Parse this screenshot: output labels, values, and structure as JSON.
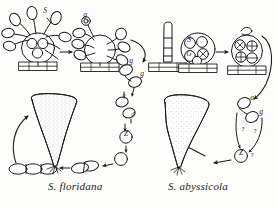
{
  "figure": {
    "kind": "life-cycle-diagram",
    "background_color": "#fdfdfb",
    "ink_color": "#1b1b1b",
    "stipple_color": "#9a958c",
    "width": 278,
    "height": 209,
    "panels": [
      {
        "id": "left",
        "caption": "S. floridana",
        "genus_abbrev": "S.",
        "species": "floridana"
      },
      {
        "id": "right",
        "caption": "S. abyssicola",
        "genus_abbrev": "S.",
        "species": "abyssicola"
      }
    ]
  },
  "captions": {
    "left": "S. floridana",
    "right": "S. abyssicola"
  },
  "labels": {
    "left_panel": [
      {
        "id": "l-s",
        "text": "S",
        "x": 45,
        "y": 13
      },
      {
        "id": "l-g-top",
        "text": "g",
        "x": 85,
        "y": 17
      },
      {
        "id": "l-g-1",
        "text": "g",
        "x": 131,
        "y": 63
      },
      {
        "id": "l-g-2",
        "text": "g",
        "x": 142,
        "y": 76
      },
      {
        "id": "l-female",
        "text": "♀",
        "x": 124,
        "y": 99
      },
      {
        "id": "l-male",
        "text": "♂",
        "x": 133,
        "y": 117
      },
      {
        "id": "l-z",
        "text": "Z",
        "x": 126,
        "y": 136
      }
    ],
    "right_panel": [
      {
        "id": "r-s",
        "text": "S",
        "x": 189,
        "y": 42
      },
      {
        "id": "r-g",
        "text": "G",
        "x": 189,
        "y": 56
      },
      {
        "id": "r-a1",
        "text": "a",
        "x": 252,
        "y": 100
      },
      {
        "id": "r-g1",
        "text": "g",
        "x": 261,
        "y": 114
      },
      {
        "id": "r-q1",
        "text": "?",
        "x": 243,
        "y": 131
      },
      {
        "id": "r-q2",
        "text": "?",
        "x": 255,
        "y": 133
      },
      {
        "id": "r-z",
        "text": "Z",
        "x": 241,
        "y": 155
      },
      {
        "id": "r-q3",
        "text": "?",
        "x": 252,
        "y": 157
      }
    ]
  },
  "symbols": {
    "plus": "+",
    "minus": "−",
    "cross": "×",
    "female": "♀",
    "male": "♂",
    "zygote": "Z",
    "sporangium": "S",
    "gametangium": "G",
    "question": "?"
  },
  "structures": {
    "left_panel": [
      {
        "name": "sporulating-thallus",
        "note": "ovoid body with three internal spore circles on branched stalks, hatched basal plate"
      },
      {
        "name": "empty-thallus",
        "note": "discharged ovoid body with external spore ovals, hatched basal plate"
      },
      {
        "name": "released-spores",
        "note": "chain of free oval spores"
      },
      {
        "name": "gamete-pair",
        "note": "two gametes labelled g"
      },
      {
        "name": "female-gamete",
        "note": "gamete marked with female sign"
      },
      {
        "name": "male-gamete",
        "note": "gamete marked with male sign"
      },
      {
        "name": "zygote",
        "note": "circled Z"
      },
      {
        "name": "germinating-cell",
        "note": "single round cell"
      },
      {
        "name": "two-celled-germling",
        "note": "two fused elongate cells"
      },
      {
        "name": "three-celled-germling",
        "note": "three elongate cells in a row"
      },
      {
        "name": "mature-trumpet-thallus",
        "note": "large stippled vase-shaped thallus with holdfast"
      }
    ],
    "right_panel": [
      {
        "name": "elongate-sporangium",
        "note": "tall segmented cylindrical body on hatched base"
      },
      {
        "name": "gametangium-thallus",
        "note": "ovoid body containing circles marked S, G and crossed circles"
      },
      {
        "name": "meiotic-thallus",
        "note": "ovoid body with circles marked plus and minus"
      },
      {
        "name": "gamete-a",
        "note": "oval gamete labelled a"
      },
      {
        "name": "gamete-g",
        "note": "oval gamete labelled g"
      },
      {
        "name": "zygote-uncertain",
        "note": "circled Z with question marks denoting uncertain stage"
      },
      {
        "name": "mature-trumpet-thallus",
        "note": "large stippled vase-shaped thallus with holdfast"
      }
    ]
  },
  "arrows": {
    "count": 16,
    "style": "solid filled arrowheads, hand-drawn"
  }
}
